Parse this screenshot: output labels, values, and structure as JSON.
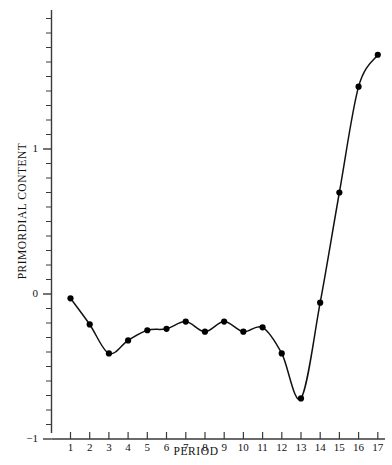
{
  "chart_data": {
    "type": "line",
    "title": "",
    "subtitle": "",
    "xlabel": "PERIOD",
    "ylabel": "PRIMORDIAL CONTENT",
    "x": [
      1,
      2,
      3,
      4,
      5,
      6,
      7,
      8,
      9,
      10,
      11,
      12,
      13,
      14,
      15,
      16,
      17
    ],
    "values": [
      -0.03,
      -0.21,
      -0.41,
      -0.32,
      -0.25,
      -0.24,
      -0.19,
      -0.26,
      -0.19,
      -0.26,
      -0.23,
      -0.41,
      -0.72,
      -0.06,
      0.7,
      1.43,
      1.65
    ],
    "series": [
      {
        "name": "Primordial content",
        "values": [
          -0.03,
          -0.21,
          -0.41,
          -0.32,
          -0.25,
          -0.24,
          -0.19,
          -0.26,
          -0.19,
          -0.26,
          -0.23,
          -0.41,
          -0.72,
          -0.06,
          0.7,
          1.43,
          1.65
        ]
      }
    ],
    "xlim": [
      0.4,
      17.6
    ],
    "ylim": [
      -1.0,
      1.9
    ],
    "xticks": [
      1,
      2,
      3,
      4,
      5,
      6,
      7,
      8,
      9,
      10,
      11,
      12,
      13,
      14,
      15,
      16,
      17
    ],
    "xtick_labels": [
      "1",
      "2",
      "3",
      "4",
      "5",
      "6",
      "7",
      "8",
      "9",
      "10",
      "11",
      "12",
      "13",
      "14",
      "15",
      "16",
      "17"
    ],
    "yticks": [
      -1,
      0,
      1
    ],
    "ytick_labels": [
      "−1",
      "0",
      "1"
    ],
    "y_minor_tick_step": 0.1,
    "grid": false,
    "legend": false,
    "legend_position": "none",
    "marker": "filled-circle",
    "line_color": "#111111",
    "marker_color": "#000000",
    "axis_color": "#3a3a3a",
    "background_color": "#ffffff",
    "annotations": []
  },
  "axes": {
    "x_title": "PERIOD",
    "y_title": "PRIMORDIAL CONTENT",
    "y_labels": [
      "1",
      "0",
      "−1"
    ],
    "x_labels": [
      "1",
      "2",
      "3",
      "4",
      "5",
      "6",
      "7",
      "8",
      "9",
      "10",
      "11",
      "12",
      "13",
      "14",
      "15",
      "16",
      "17"
    ]
  }
}
